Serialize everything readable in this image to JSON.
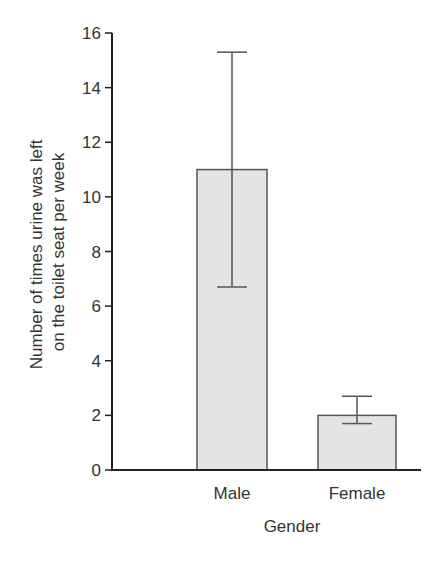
{
  "chart_data": {
    "type": "bar",
    "title": "",
    "xlabel": "Gender",
    "ylabel_lines": [
      "Number of times urine was left",
      "on the toilet seat per week"
    ],
    "ylabel": "Number of times urine was left on the toilet seat per week",
    "categories": [
      "Male",
      "Female"
    ],
    "values": [
      11,
      2
    ],
    "error_bars": [
      {
        "category": "Male",
        "lower": 6.7,
        "upper": 15.3
      },
      {
        "category": "Female",
        "lower": 1.7,
        "upper": 2.7
      }
    ],
    "ylim": [
      0,
      16
    ],
    "yticks": [
      0,
      2,
      4,
      6,
      8,
      10,
      12,
      14,
      16
    ],
    "grid": false,
    "legend": null,
    "colors": {
      "bar_fill": "#e4e4e4",
      "bar_stroke": "#555555",
      "axis": "#222222"
    }
  }
}
